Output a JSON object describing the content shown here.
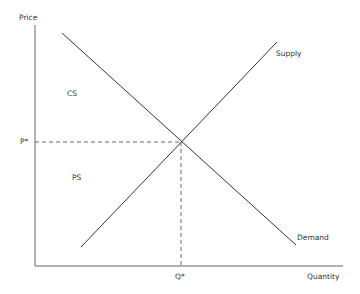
{
  "diagram": {
    "type": "supply-demand",
    "axes": {
      "y_label": "Price",
      "x_label": "Quantity"
    },
    "curves": {
      "supply": {
        "label": "Supply"
      },
      "demand": {
        "label": "Demand"
      }
    },
    "equilibrium": {
      "price_label": "P*",
      "quantity_label": "Q*"
    },
    "regions": {
      "consumer_surplus": "CS",
      "producer_surplus": "PS"
    },
    "colors": {
      "line": "#333333",
      "axis": "#555555"
    }
  }
}
